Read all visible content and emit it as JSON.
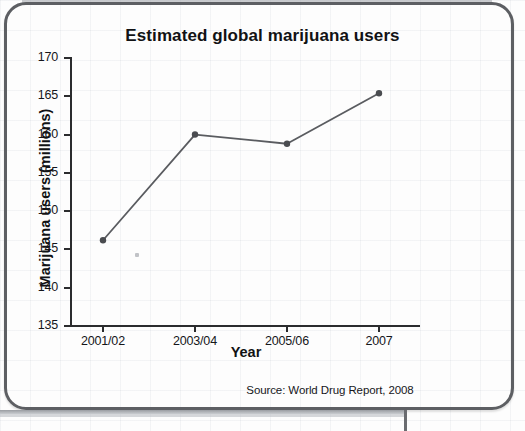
{
  "source_note": "Source: World Drug Report, 2008",
  "chart_data": {
    "type": "line",
    "title": "Estimated global marijuana users",
    "xlabel": "Year",
    "ylabel": "Marijuana users (millions)",
    "categories": [
      "2001/02",
      "2003/04",
      "2005/06",
      "2007"
    ],
    "values": [
      146.2,
      160.0,
      158.8,
      165.4
    ],
    "ylim": [
      135,
      170
    ],
    "yticks": [
      135,
      140,
      145,
      150,
      155,
      160,
      165,
      170
    ],
    "ytick_labels": [
      "135",
      "140",
      "145",
      "150",
      "155",
      "160",
      "165",
      "170"
    ],
    "grid": false,
    "legend": "none",
    "series_color": "#5a5c60",
    "marker": "circle",
    "marker_color": "#4a4c50",
    "axis_color": "#2b2c2e"
  }
}
